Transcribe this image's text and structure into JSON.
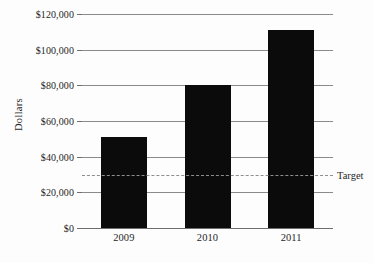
{
  "chart_data": {
    "type": "bar",
    "title": "",
    "subtitle": "",
    "xlabel": "",
    "ylabel": "Dollars",
    "categories": [
      "2009",
      "2010",
      "2011"
    ],
    "values": [
      51000,
      80000,
      111000
    ],
    "series": [
      {
        "name": "Dollars",
        "values": [
          51000,
          80000,
          111000
        ]
      }
    ],
    "ylim": [
      0,
      120000
    ],
    "y_ticks": [
      0,
      20000,
      40000,
      60000,
      80000,
      100000,
      120000
    ],
    "y_tick_labels": [
      "$0",
      "$20,000",
      "$40,000",
      "$60,000",
      "$80,000",
      "$100,000",
      "$120,000"
    ],
    "grid": true,
    "legend_position": "none",
    "annotations": [
      {
        "name": "target",
        "label": "Target",
        "value": 30000,
        "style": "dashed-horizontal-line"
      }
    ],
    "colors": {
      "bar": "#0b0b0b",
      "gridline": "#8a8a8a",
      "axis": "#6e6e6e",
      "target_line": "#8e8e8e",
      "text": "#1f1f1f",
      "background": "#fdfdfd"
    }
  }
}
